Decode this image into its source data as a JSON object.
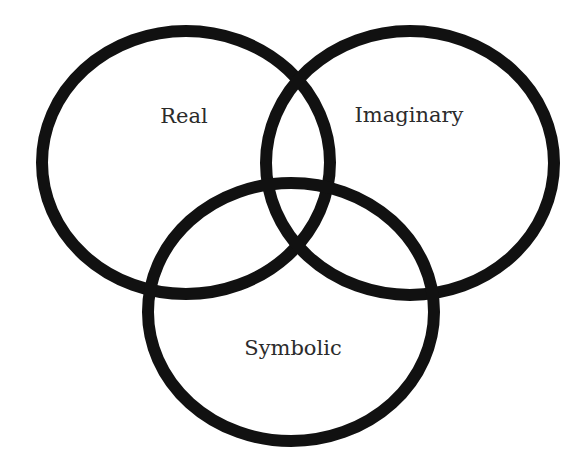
{
  "diagram": {
    "type": "venn",
    "stroke_color": "#111111",
    "text_color": "#2b2b2b",
    "background": "#ffffff",
    "circles": [
      {
        "name": "real",
        "label": "Real",
        "cx": 186,
        "cy": 162.5,
        "rx": 144,
        "ry": 131.5,
        "label_x": 184,
        "label_y": 123
      },
      {
        "name": "imaginary",
        "label": "Imaginary",
        "cx": 410,
        "cy": 163,
        "rx": 144,
        "ry": 132,
        "label_x": 409,
        "label_y": 122
      },
      {
        "name": "symbolic",
        "label": "Symbolic",
        "cx": 291,
        "cy": 312,
        "rx": 143,
        "ry": 129,
        "label_x": 293,
        "label_y": 355
      }
    ]
  }
}
